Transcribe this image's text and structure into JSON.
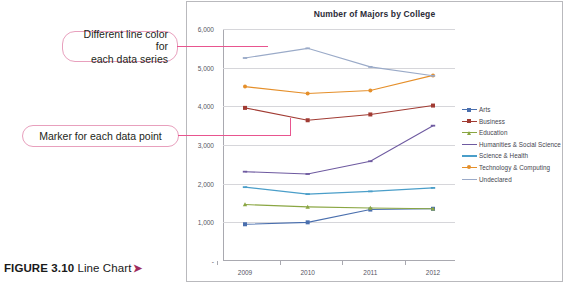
{
  "figure": {
    "number": "FIGURE 3.10",
    "title": "Line Chart",
    "arrow": "➤"
  },
  "callouts": [
    {
      "name": "line-color",
      "text": "Different line color for\neach data series"
    },
    {
      "name": "marker",
      "text": "Marker for each data point"
    }
  ],
  "chart_data": {
    "type": "line",
    "title": "Number of Majors by College",
    "xlabel": "",
    "ylabel": "",
    "categories": [
      "2009",
      "2010",
      "2011",
      "2012"
    ],
    "ytick_labels": [
      "6,000",
      "5,000",
      "4,000",
      "3,000",
      "2,000",
      "1,000",
      "-"
    ],
    "ytick_values": [
      6000,
      5000,
      4000,
      3000,
      2000,
      1000,
      0
    ],
    "ylim": [
      0,
      6000
    ],
    "grid": true,
    "legend_position": "right",
    "series": [
      {
        "name": "Arts",
        "color": "#4a6fae",
        "marker": "square",
        "values": [
          950,
          1000,
          1330,
          1350
        ]
      },
      {
        "name": "Business",
        "color": "#a13b33",
        "marker": "square",
        "values": [
          3960,
          3640,
          3790,
          4020
        ]
      },
      {
        "name": "Education",
        "color": "#8aa642",
        "marker": "triangle",
        "values": [
          1460,
          1400,
          1370,
          1350
        ]
      },
      {
        "name": "Humanities & Social Science",
        "color": "#6e5aa0",
        "marker": "line",
        "values": [
          2310,
          2250,
          2580,
          3500
        ]
      },
      {
        "name": "Science & Health",
        "color": "#4a9ec9",
        "marker": "line",
        "values": [
          1910,
          1730,
          1800,
          1890
        ]
      },
      {
        "name": "Technology & Computing",
        "color": "#e58f2a",
        "marker": "circle",
        "values": [
          4510,
          4330,
          4410,
          4800
        ]
      },
      {
        "name": "Undeclared",
        "color": "#9aaac8",
        "marker": "line",
        "values": [
          5250,
          5500,
          5020,
          4790
        ]
      }
    ]
  }
}
